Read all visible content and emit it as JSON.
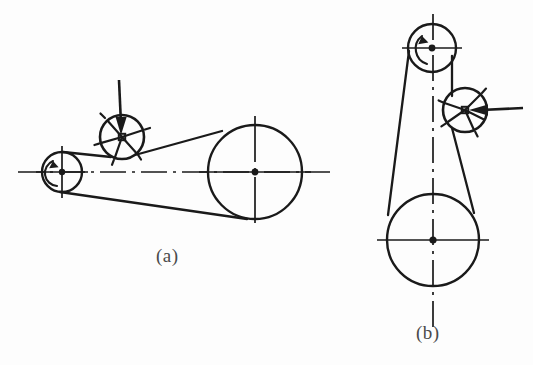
{
  "figure": {
    "type": "engineering-diagram",
    "background_color": "#fdfdfd",
    "line_color": "#1a1a1a",
    "caption_color": "#4a4a4a"
  },
  "captions": {
    "a": "(a)",
    "b": "(b)"
  },
  "diagram_a": {
    "label": "(a)",
    "orientation": "horizontal",
    "centerline": {
      "y": 172,
      "x_start": 18,
      "x_end": 330,
      "style": "dash-dot"
    },
    "pulleys": [
      {
        "name": "driving-pulley",
        "cx": 62,
        "cy": 172,
        "r": 20,
        "crosshair_extent": 13,
        "hub_r": 3.2,
        "rotation": "counterclockwise"
      },
      {
        "name": "driven-pulley",
        "cx": 255,
        "cy": 172,
        "r": 47,
        "crosshair_extent": 28,
        "hub_r": 3.4,
        "rotation": "counterclockwise"
      },
      {
        "name": "idler-pulley",
        "cx": 122,
        "cy": 137,
        "r": 22,
        "hub_half": 3.2,
        "spokes": 5,
        "hub_shape": "square"
      }
    ],
    "force_arrow": {
      "name": "idler-force-arrow",
      "direction": "down",
      "x1": 119,
      "y1": 80,
      "x2": 121,
      "y2": 133
    },
    "rotation_arrow": {
      "name": "driving-rotation-arrow",
      "direction": "counterclockwise"
    },
    "belt": {
      "upper_run": "driving-pulley top to idler to driven-pulley top",
      "lower_run": "driving-pulley bottom to driven-pulley bottom"
    }
  },
  "diagram_b": {
    "label": "(b)",
    "orientation": "vertical",
    "centerline": {
      "x": 433,
      "y_start": 14,
      "y_end": 330,
      "style": "dash-dot"
    },
    "pulleys": [
      {
        "name": "driving-pulley",
        "cx": 432,
        "cy": 48,
        "r": 24,
        "crosshair_extent": 15,
        "hub_r": 3.4,
        "rotation": "counterclockwise"
      },
      {
        "name": "driven-pulley",
        "cx": 433,
        "cy": 240,
        "r": 46,
        "crosshair_extent": 28,
        "hub_r": 3.6,
        "rotation": "counterclockwise"
      },
      {
        "name": "idler-pulley",
        "cx": 465,
        "cy": 110,
        "r": 22,
        "hub_half": 3.2,
        "spokes": 5,
        "hub_shape": "square"
      }
    ],
    "force_arrow": {
      "name": "idler-force-arrow",
      "direction": "left",
      "x1": 523,
      "y1": 109,
      "x2": 470,
      "y2": 110
    },
    "rotation_arrow": {
      "name": "driving-rotation-arrow",
      "direction": "counterclockwise"
    },
    "belt": {
      "left_run": "driving-pulley left tangent down to driven-pulley left tangent",
      "right_run": "driving-pulley right tangent through idler down to driven-pulley right tangent"
    }
  }
}
